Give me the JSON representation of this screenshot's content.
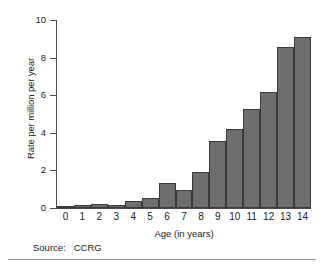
{
  "chart_data": {
    "type": "bar",
    "title": "",
    "xlabel": "Age (in years)",
    "ylabel": "Rate per million per year",
    "categories": [
      "0",
      "1",
      "2",
      "3",
      "4",
      "5",
      "6",
      "7",
      "8",
      "9",
      "10",
      "11",
      "12",
      "13",
      "14"
    ],
    "values": [
      0.1,
      0.15,
      0.2,
      0.18,
      0.38,
      0.55,
      1.35,
      0.95,
      1.9,
      3.55,
      4.2,
      5.25,
      6.15,
      8.55,
      9.1
    ],
    "ylim": [
      0,
      10
    ],
    "yticks": [
      0,
      2,
      4,
      6,
      8,
      10
    ],
    "xticks": [
      "0",
      "1",
      "2",
      "3",
      "4",
      "5",
      "6",
      "7",
      "8",
      "9",
      "10",
      "11",
      "12",
      "13",
      "14"
    ],
    "grid": false,
    "legend": null,
    "bar_color": "#6e6e6e",
    "bar_edge_color": "#3a3a3a"
  },
  "figure": {
    "source_note": "Source:   CCRG"
  }
}
